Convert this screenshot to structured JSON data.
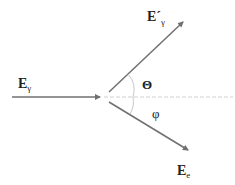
{
  "diagram": {
    "labels": {
      "incident_photon": {
        "main": "E",
        "sub": "γ"
      },
      "scattered_photon": {
        "main": "E´",
        "sub": "γ"
      },
      "electron": {
        "main": "E",
        "sub": "e"
      },
      "theta": "Θ",
      "phi": "φ"
    },
    "colors": {
      "arrow": "#707070",
      "axis_dashed": "#d0d0d0",
      "arc": "#c8c8c8",
      "text": "#222222"
    }
  }
}
